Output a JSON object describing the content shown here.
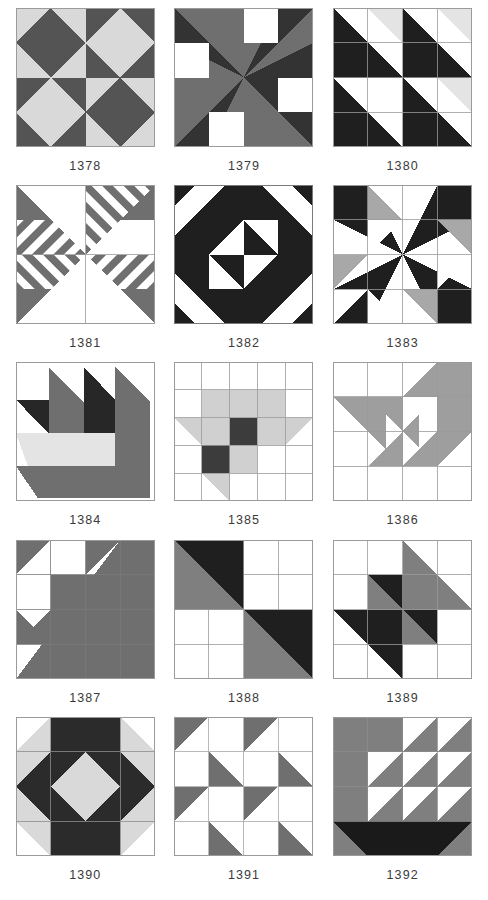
{
  "page": {
    "type": "quilt-block-pattern-sheet",
    "columns": 3,
    "rows": 5,
    "background": "#ffffff"
  },
  "palette": {
    "white": "#ffffff",
    "light_gray": "#d9d9d9",
    "pale_gray": "#e8e8e8",
    "medium_gray": "#7f7f7f",
    "dark_gray": "#545454",
    "black": "#1a1a1a",
    "outline": "#9a9a9a",
    "caption_color": "#3a3a3a"
  },
  "blocks": [
    {
      "id": "1378",
      "caption": "1378",
      "units": 2,
      "desc": "four square-in-a-square diamonds, alternating dark and light",
      "shapes": [
        {
          "t": "rect",
          "pts": [
            0,
            0,
            70,
            70
          ],
          "c": "#d9d9d9"
        },
        {
          "t": "poly",
          "pts": [
            35,
            0,
            70,
            35,
            35,
            70,
            0,
            35
          ],
          "c": "#545454"
        },
        {
          "t": "rect",
          "pts": [
            70,
            0,
            70,
            70
          ],
          "c": "#545454"
        },
        {
          "t": "poly",
          "pts": [
            105,
            0,
            140,
            35,
            105,
            70,
            70,
            35
          ],
          "c": "#d9d9d9"
        },
        {
          "t": "rect",
          "pts": [
            0,
            70,
            70,
            70
          ],
          "c": "#545454"
        },
        {
          "t": "poly",
          "pts": [
            35,
            70,
            70,
            105,
            35,
            140,
            0,
            105
          ],
          "c": "#d9d9d9"
        },
        {
          "t": "rect",
          "pts": [
            70,
            70,
            70,
            70
          ],
          "c": "#d9d9d9"
        },
        {
          "t": "poly",
          "pts": [
            105,
            70,
            140,
            105,
            105,
            140,
            70,
            105
          ],
          "c": "#545454"
        }
      ]
    },
    {
      "id": "1379",
      "caption": "1379",
      "units": 4,
      "desc": "pinwheel of large gray and dark triangles with four white corner squares",
      "shapes": [
        {
          "t": "rect",
          "pts": [
            0,
            0,
            140,
            140
          ],
          "c": "#ffffff"
        },
        {
          "t": "poly",
          "pts": [
            0,
            0,
            105,
            0,
            70,
            70
          ],
          "c": "#7f7f7f"
        },
        {
          "t": "poly",
          "pts": [
            0,
            0,
            0,
            105,
            70,
            70
          ],
          "c": "#3a3a3a"
        },
        {
          "t": "poly",
          "pts": [
            140,
            0,
            140,
            105,
            70,
            70
          ],
          "c": "#7f7f7f"
        },
        {
          "t": "poly",
          "pts": [
            105,
            0,
            140,
            0,
            70,
            70
          ],
          "c": "#3a3a3a"
        },
        {
          "t": "poly",
          "pts": [
            0,
            140,
            0,
            35,
            70,
            70
          ],
          "c": "#7f7f7f"
        },
        {
          "t": "poly",
          "pts": [
            0,
            140,
            35,
            140,
            70,
            70
          ],
          "c": "#3a3a3a"
        },
        {
          "t": "poly",
          "pts": [
            140,
            140,
            35,
            140,
            70,
            70
          ],
          "c": "#7f7f7f"
        },
        {
          "t": "poly",
          "pts": [
            140,
            140,
            140,
            35,
            70,
            70
          ],
          "c": "#3a3a3a"
        },
        {
          "t": "rect",
          "pts": [
            70,
            0,
            35,
            35
          ],
          "c": "#ffffff"
        },
        {
          "t": "rect",
          "pts": [
            0,
            35,
            35,
            35
          ],
          "c": "#ffffff"
        },
        {
          "t": "rect",
          "pts": [
            105,
            70,
            35,
            35
          ],
          "c": "#ffffff"
        },
        {
          "t": "rect",
          "pts": [
            35,
            105,
            35,
            35
          ],
          "c": "#ffffff"
        }
      ]
    },
    {
      "id": "1380",
      "caption": "1380",
      "units": 4,
      "desc": "four quadrants, each a large black half-square triangle with a pale corner triangle",
      "gridlines": 4
    },
    {
      "id": "1381",
      "caption": "1381",
      "units": 2,
      "desc": "pinwheel of four large triangles filled with dark striped bands on white"
    },
    {
      "id": "1382",
      "caption": "1382",
      "units": 8,
      "desc": "black on point square frame with striped corners and a central pinwheel"
    },
    {
      "id": "1383",
      "caption": "1383",
      "units": 4,
      "desc": "black pinwheel of long triangles with gray accent triangles, thin grid showing"
    },
    {
      "id": "1384",
      "caption": "1384",
      "units": 4,
      "desc": "pine tree / sawtooth block, gray and dark vertical spikes over pale base"
    },
    {
      "id": "1385",
      "caption": "1385",
      "units": 4,
      "desc": "gray star with dark four-patch center on white grid"
    },
    {
      "id": "1386",
      "caption": "1386",
      "units": 4,
      "desc": "gray spiral / snail trail motif with small on-point squares in the center"
    },
    {
      "id": "1387",
      "caption": "1387",
      "units": 4,
      "desc": "large gray half-square triangle with stepped sawtooth edge"
    },
    {
      "id": "1388",
      "caption": "1388",
      "units": 4,
      "desc": "two large black and gray half-square triangles set diagonally on white four patches"
    },
    {
      "id": "1389",
      "caption": "1389",
      "units": 4,
      "desc": "gray and black pinwheel of half-square triangles on white grid"
    },
    {
      "id": "1390",
      "caption": "1390",
      "units": 4,
      "desc": "dark on point square with pale center, pale corner triangles and side triangles"
    },
    {
      "id": "1391",
      "caption": "1391",
      "units": 4,
      "desc": "sixteen half-square triangles in gray and white, broken dashes layout"
    },
    {
      "id": "1392",
      "caption": "1392",
      "units": 4,
      "desc": "gray field with white half-square triangles stepping down, black bottom triangle row"
    }
  ]
}
